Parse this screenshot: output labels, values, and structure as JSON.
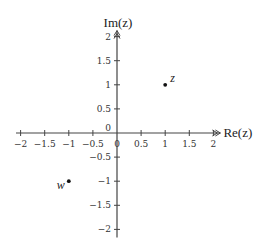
{
  "diagram": {
    "type": "complex-plane",
    "x_axis": {
      "title": "Re(z)",
      "range": [
        -2,
        2
      ],
      "ticks": [
        -2,
        -1.5,
        -1,
        -0.5,
        0,
        0.5,
        1,
        1.5,
        2
      ],
      "tick_labels": [
        "−2",
        "−1.5",
        "−1",
        "−0.5",
        "0",
        "0.5",
        "1",
        "1.5",
        "2"
      ]
    },
    "y_axis": {
      "title": "Im(z)",
      "range": [
        -2,
        2
      ],
      "ticks": [
        -2,
        -1.5,
        -1,
        -0.5,
        0,
        0.5,
        1,
        1.5,
        2
      ],
      "tick_labels": [
        "−2",
        "−1.5",
        "−1",
        "−0.5",
        "0",
        "0.5",
        "1",
        "1.5",
        "2"
      ]
    },
    "points": [
      {
        "name": "z",
        "label": "z",
        "re": 1,
        "im": 1,
        "label_side": "upper-right"
      },
      {
        "name": "w",
        "label": "w",
        "re": -1,
        "im": -1,
        "label_side": "lower-left"
      }
    ],
    "colors": {
      "axis": "#444444",
      "text": "#222222",
      "point": "#111111"
    }
  }
}
